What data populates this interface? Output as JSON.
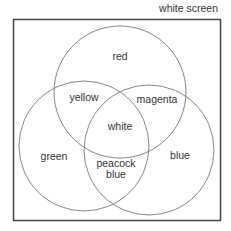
{
  "title": "white screen",
  "regions": {
    "red": "red",
    "green": "green",
    "blue": "blue",
    "yellow": "yellow",
    "magenta": "magenta",
    "peacock_line1": "peacock",
    "peacock_line2": "blue",
    "white": "white"
  },
  "colors": {
    "stroke": "#6a6a6a",
    "frame": "#444444",
    "text": "#333333"
  }
}
